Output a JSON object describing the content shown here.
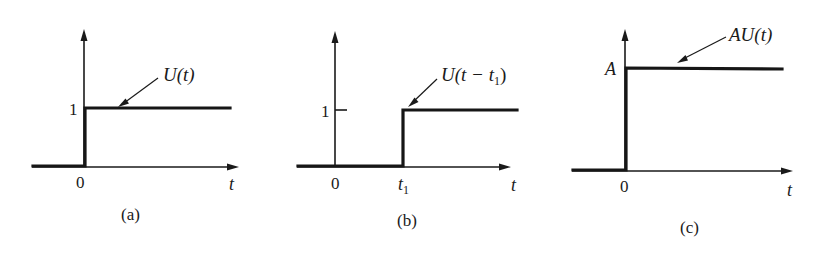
{
  "figure": {
    "panels": [
      {
        "id": "a",
        "caption": "(a)",
        "function_label": "U(t)",
        "level_label": "1",
        "origin_label": "0",
        "axis_label": "t",
        "step_time": "0",
        "step_level": "1"
      },
      {
        "id": "b",
        "caption": "(b)",
        "function_label_main": "U(t − t",
        "function_label_sub": "1",
        "function_label_close": ")",
        "level_label": "1",
        "origin_label": "0",
        "step_label_main": "t",
        "step_label_sub": "1",
        "axis_label": "t",
        "step_time": "t1",
        "step_level": "1"
      },
      {
        "id": "c",
        "caption": "(c)",
        "function_label": "AU(t)",
        "level_label": "A",
        "origin_label": "0",
        "axis_label": "t",
        "step_time": "0",
        "step_level": "A"
      }
    ],
    "colors": {
      "ink": "#1a1a1a",
      "background": "#ffffff"
    }
  }
}
